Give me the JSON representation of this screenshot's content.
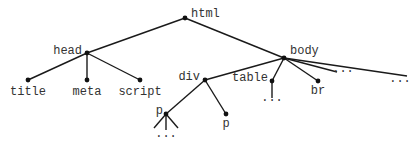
{
  "diagram": {
    "type": "tree",
    "title": "",
    "colors": {
      "edge": "#1a1a1a",
      "node": "#111111",
      "label": "#333333",
      "background": "#ffffff"
    },
    "nodes": [
      {
        "id": "html",
        "label": "html",
        "x": 185,
        "y": 18,
        "lx": 191,
        "ly": 17,
        "anchor": "start",
        "dot": true
      },
      {
        "id": "head",
        "label": "head",
        "x": 87,
        "y": 53,
        "lx": 82,
        "ly": 54,
        "anchor": "end",
        "dot": true
      },
      {
        "id": "body",
        "label": "body",
        "x": 284,
        "y": 58,
        "lx": 290,
        "ly": 54,
        "anchor": "start",
        "dot": true
      },
      {
        "id": "title",
        "label": "title",
        "x": 28,
        "y": 80,
        "lx": 28,
        "ly": 95,
        "anchor": "middle",
        "dot": true
      },
      {
        "id": "meta",
        "label": "meta",
        "x": 87,
        "y": 80,
        "lx": 87,
        "ly": 95,
        "anchor": "middle",
        "dot": true
      },
      {
        "id": "script",
        "label": "script",
        "x": 140,
        "y": 80,
        "lx": 140,
        "ly": 95,
        "anchor": "middle",
        "dot": true
      },
      {
        "id": "div",
        "label": "div",
        "x": 205,
        "y": 80,
        "lx": 200,
        "ly": 80,
        "anchor": "end",
        "dot": true
      },
      {
        "id": "table",
        "label": "table",
        "x": 272,
        "y": 81,
        "lx": 268,
        "ly": 81,
        "anchor": "end",
        "dot": true
      },
      {
        "id": "br",
        "label": "br",
        "x": 318,
        "y": 81,
        "lx": 318,
        "ly": 94,
        "anchor": "middle",
        "dot": true
      },
      {
        "id": "more1",
        "label": "...",
        "x": 337,
        "y": 72,
        "lx": 343,
        "ly": 72,
        "anchor": "middle",
        "dot": false
      },
      {
        "id": "more2",
        "label": "...",
        "x": 407,
        "y": 76,
        "lx": 400,
        "ly": 82,
        "anchor": "middle",
        "dot": false
      },
      {
        "id": "table_more",
        "label": "...",
        "x": 272,
        "y": 98,
        "lx": 272,
        "ly": 101,
        "anchor": "middle",
        "dot": false
      },
      {
        "id": "p1",
        "label": "p",
        "x": 166,
        "y": 114,
        "lx": 163,
        "ly": 114,
        "anchor": "end",
        "dot": true
      },
      {
        "id": "p2",
        "label": "p",
        "x": 226,
        "y": 114,
        "lx": 226,
        "ly": 127,
        "anchor": "middle",
        "dot": true
      },
      {
        "id": "p1_more",
        "label": "...",
        "x": 166,
        "y": 132,
        "lx": 166,
        "ly": 137,
        "anchor": "middle",
        "dot": false
      }
    ],
    "edges": [
      [
        "html",
        "head"
      ],
      [
        "html",
        "body"
      ],
      [
        "head",
        "title"
      ],
      [
        "head",
        "meta"
      ],
      [
        "head",
        "script"
      ],
      [
        "body",
        "div"
      ],
      [
        "body",
        "table"
      ],
      [
        "body",
        "br"
      ],
      [
        "body",
        "more1"
      ],
      [
        "body",
        "more2"
      ],
      [
        "table",
        "table_more"
      ],
      [
        "div",
        "p1"
      ],
      [
        "div",
        "p2"
      ]
    ],
    "fan_edges": [
      {
        "from": "p1",
        "to": [
          [
            154,
            128
          ],
          [
            166,
            130
          ],
          [
            178,
            128
          ]
        ]
      }
    ]
  }
}
